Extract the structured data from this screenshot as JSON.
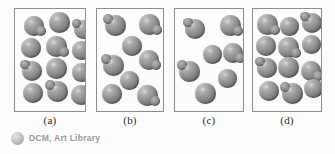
{
  "figure": {
    "background_color": "#fdfdfd",
    "panel_border_color": "#8d8d8d",
    "sphere_color": "#8e8e8e",
    "label_color": "#2b2b2b"
  },
  "credit": {
    "text": "DCM, Art Library",
    "logo_icon": "sphere-icon",
    "text_color": "#9a9a9a"
  },
  "chart_data": {
    "type": "scatter",
    "title": "",
    "xlabel": "",
    "ylabel": "",
    "panels": [
      {
        "label": "(a)",
        "count": 12,
        "density": "high",
        "left": 14,
        "top": 8,
        "width": 72,
        "height": 104,
        "points": [
          {
            "x": 9,
            "y": 7,
            "r": 20,
            "lump": "right"
          },
          {
            "x": 34,
            "y": 3,
            "r": 21,
            "lump": "none"
          },
          {
            "x": 59,
            "y": 11,
            "r": 19,
            "lump": "left"
          },
          {
            "x": 6,
            "y": 29,
            "r": 20,
            "lump": "none"
          },
          {
            "x": 31,
            "y": 27,
            "r": 21,
            "lump": "right"
          },
          {
            "x": 57,
            "y": 32,
            "r": 19,
            "lump": "none"
          },
          {
            "x": 7,
            "y": 52,
            "r": 20,
            "lump": "left"
          },
          {
            "x": 31,
            "y": 49,
            "r": 21,
            "lump": "none"
          },
          {
            "x": 57,
            "y": 54,
            "r": 19,
            "lump": "right"
          },
          {
            "x": 8,
            "y": 74,
            "r": 20,
            "lump": "none"
          },
          {
            "x": 32,
            "y": 72,
            "r": 21,
            "lump": "left"
          },
          {
            "x": 56,
            "y": 76,
            "r": 20,
            "lump": "none"
          }
        ]
      },
      {
        "label": "(b)",
        "count": 7,
        "density": "medium",
        "left": 96,
        "top": 8,
        "width": 68,
        "height": 104,
        "points": [
          {
            "x": 8,
            "y": 6,
            "r": 21,
            "lump": "left"
          },
          {
            "x": 42,
            "y": 5,
            "r": 21,
            "lump": "right"
          },
          {
            "x": 25,
            "y": 27,
            "r": 20,
            "lump": "none"
          },
          {
            "x": 6,
            "y": 46,
            "r": 21,
            "lump": "left"
          },
          {
            "x": 42,
            "y": 41,
            "r": 20,
            "lump": "right"
          },
          {
            "x": 23,
            "y": 62,
            "r": 19,
            "lump": "none"
          },
          {
            "x": 5,
            "y": 75,
            "r": 20,
            "lump": "none"
          },
          {
            "x": 40,
            "y": 76,
            "r": 21,
            "lump": "right"
          }
        ]
      },
      {
        "label": "(c)",
        "count": 7,
        "density": "low",
        "left": 174,
        "top": 8,
        "width": 70,
        "height": 104,
        "points": [
          {
            "x": 10,
            "y": 10,
            "r": 20,
            "lump": "left"
          },
          {
            "x": 45,
            "y": 6,
            "r": 21,
            "lump": "right"
          },
          {
            "x": 28,
            "y": 36,
            "r": 19,
            "lump": "none"
          },
          {
            "x": 48,
            "y": 34,
            "r": 20,
            "lump": "right"
          },
          {
            "x": 4,
            "y": 52,
            "r": 21,
            "lump": "left"
          },
          {
            "x": 43,
            "y": 60,
            "r": 19,
            "lump": "none"
          },
          {
            "x": 20,
            "y": 74,
            "r": 21,
            "lump": "none"
          }
        ]
      },
      {
        "label": "(d)",
        "count": 12,
        "density": "high",
        "left": 252,
        "top": 8,
        "width": 70,
        "height": 104,
        "points": [
          {
            "x": 4,
            "y": 5,
            "r": 21,
            "lump": "right"
          },
          {
            "x": 27,
            "y": 8,
            "r": 19,
            "lump": "none"
          },
          {
            "x": 49,
            "y": 4,
            "r": 20,
            "lump": "left"
          },
          {
            "x": 3,
            "y": 27,
            "r": 20,
            "lump": "none"
          },
          {
            "x": 25,
            "y": 28,
            "r": 21,
            "lump": "right"
          },
          {
            "x": 49,
            "y": 26,
            "r": 19,
            "lump": "none"
          },
          {
            "x": 4,
            "y": 49,
            "r": 20,
            "lump": "left"
          },
          {
            "x": 25,
            "y": 48,
            "r": 21,
            "lump": "none"
          },
          {
            "x": 48,
            "y": 52,
            "r": 20,
            "lump": "right"
          },
          {
            "x": 6,
            "y": 72,
            "r": 20,
            "lump": "none"
          },
          {
            "x": 29,
            "y": 74,
            "r": 21,
            "lump": "left"
          },
          {
            "x": 51,
            "y": 70,
            "r": 19,
            "lump": "none"
          }
        ]
      }
    ]
  }
}
